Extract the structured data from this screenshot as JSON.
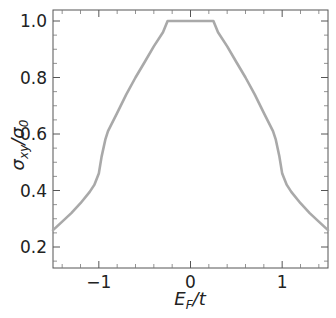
{
  "chart_data": {
    "type": "line",
    "title": "",
    "xlabel": "E_F/t",
    "ylabel": "σ_xy/σ_0",
    "xlabel_parts": {
      "main": "E",
      "sub": "F",
      "rest": "/t"
    },
    "ylabel_parts": {
      "a": "σ",
      "a_sub": "xy",
      "sep": "/",
      "b": "σ",
      "b_sub": "0"
    },
    "xlim": [
      -1.5,
      1.5
    ],
    "ylim": [
      0.13,
      1.04
    ],
    "xticks": [
      -1,
      0,
      1
    ],
    "xtick_labels": [
      "−1",
      "0",
      "1"
    ],
    "yticks": [
      0.2,
      0.4,
      0.6,
      0.8,
      1.0
    ],
    "ytick_labels": [
      "0.2",
      "0.4",
      "0.6",
      "0.8",
      "1.0"
    ],
    "grid": false,
    "legend": null,
    "series": [
      {
        "name": "sigma_xy",
        "color": "#a9a9a9",
        "x": [
          -1.5,
          -1.4,
          -1.3,
          -1.2,
          -1.1,
          -1.05,
          -1.0,
          -0.97,
          -0.93,
          -0.9,
          -0.8,
          -0.7,
          -0.6,
          -0.5,
          -0.4,
          -0.3,
          -0.25,
          0.0,
          0.25,
          0.3,
          0.4,
          0.5,
          0.6,
          0.7,
          0.8,
          0.9,
          0.93,
          0.97,
          1.0,
          1.05,
          1.1,
          1.2,
          1.3,
          1.4,
          1.5
        ],
        "y": [
          0.26,
          0.29,
          0.32,
          0.355,
          0.395,
          0.42,
          0.46,
          0.52,
          0.58,
          0.61,
          0.675,
          0.74,
          0.8,
          0.855,
          0.91,
          0.96,
          1.0,
          1.0,
          1.0,
          0.96,
          0.91,
          0.855,
          0.8,
          0.74,
          0.675,
          0.61,
          0.58,
          0.52,
          0.46,
          0.42,
          0.395,
          0.355,
          0.32,
          0.29,
          0.26
        ]
      }
    ]
  }
}
